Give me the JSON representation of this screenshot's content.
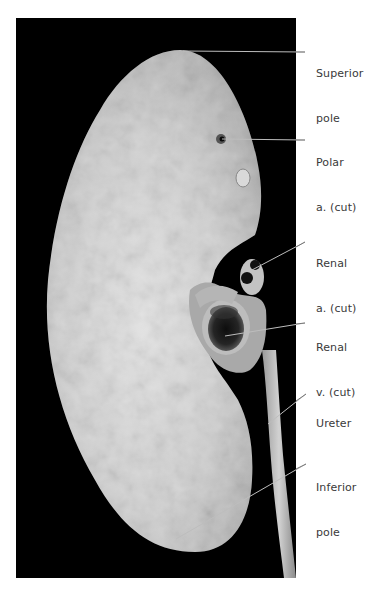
{
  "figure": {
    "background_color": "#000000",
    "specimen": "kidney",
    "labels": [
      {
        "id": "superior-pole",
        "line1": "Superior",
        "line2": "pole"
      },
      {
        "id": "polar-artery",
        "line1": "Polar",
        "line2": "a. (cut)"
      },
      {
        "id": "renal-artery",
        "line1": "Renal",
        "line2": "a. (cut)"
      },
      {
        "id": "renal-vein",
        "line1": "Renal",
        "line2": "v. (cut)"
      },
      {
        "id": "ureter",
        "line1": "Ureter",
        "line2": ""
      },
      {
        "id": "inferior-pole",
        "line1": "Inferior",
        "line2": "pole"
      }
    ]
  }
}
